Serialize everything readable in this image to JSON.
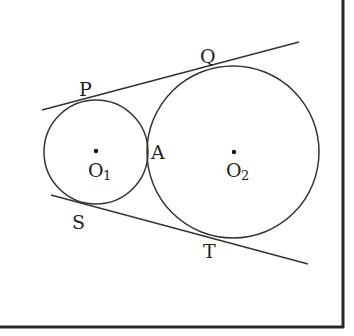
{
  "diagram": {
    "colors": {
      "stroke": "#333333",
      "frame": "#2a2a2a",
      "text": "#222222",
      "background": "#ffffff"
    },
    "frame": {
      "right_x": 343,
      "bottom_y": 327,
      "right_top_y": 0,
      "bottom_left_x": 0
    },
    "circles": [
      {
        "id": "circle-O1",
        "cx": 96,
        "cy": 152,
        "r": 52
      },
      {
        "id": "circle-O2",
        "cx": 233,
        "cy": 152,
        "r": 86
      }
    ],
    "tangent_lines": [
      {
        "id": "upper-tangent",
        "x1": 42,
        "y1": 110,
        "x2": 299,
        "y2": 42
      },
      {
        "id": "lower-tangent",
        "x1": 51,
        "y1": 195,
        "x2": 308,
        "y2": 264
      }
    ],
    "centers": [
      {
        "id": "O1",
        "dot_x": 96,
        "dot_y": 151
      },
      {
        "id": "O2",
        "dot_x": 234,
        "dot_y": 152
      }
    ],
    "labels": {
      "P": {
        "text": "P",
        "x": 79,
        "y": 96
      },
      "Q": {
        "text": "Q",
        "x": 200,
        "y": 63
      },
      "S": {
        "text": "S",
        "x": 72,
        "y": 229
      },
      "T": {
        "text": "T",
        "x": 203,
        "y": 258
      },
      "A": {
        "text": "A",
        "x": 151,
        "y": 159
      },
      "O1": {
        "text": "O",
        "sub": "1",
        "x": 88,
        "y": 177,
        "sub_x": 103,
        "sub_y": 180
      },
      "O2": {
        "text": "O",
        "sub": "2",
        "x": 226,
        "y": 177,
        "sub_x": 241,
        "sub_y": 180
      }
    }
  }
}
